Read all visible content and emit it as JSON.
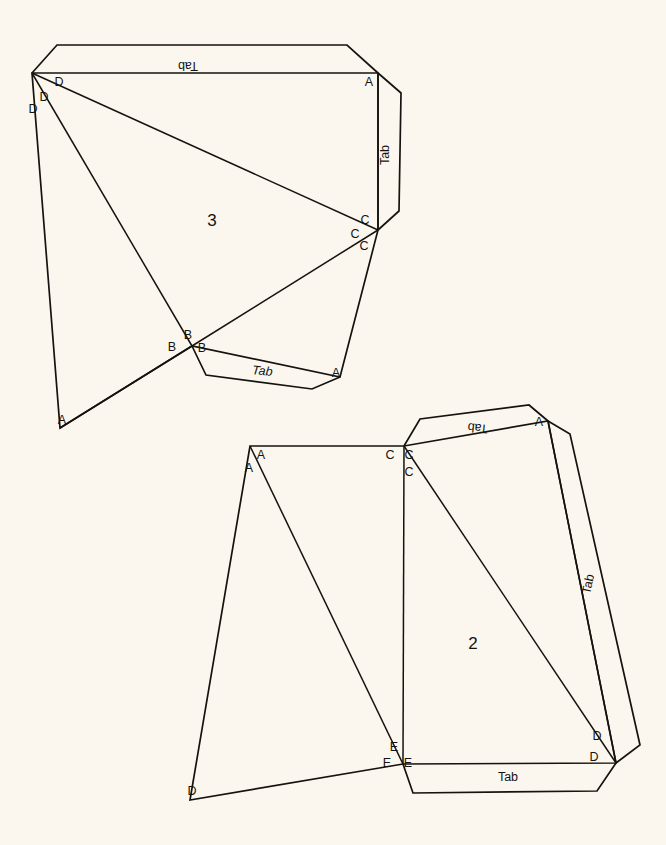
{
  "document": {
    "title": "Polyhedron Net Template",
    "background_color": "#fbf7ef",
    "ink_color": "#15130f",
    "width": 666,
    "height": 845
  },
  "nets": [
    {
      "id": "net-3",
      "number_label": "3",
      "number_pos": {
        "x": 212,
        "y": 226
      },
      "outline": "32,73 340,73 378,73 378,230 340,377 192,346 60,428",
      "vertex_labels": [
        {
          "text": "D",
          "x": 59,
          "y": 86,
          "name": "vertex-label-d-1"
        },
        {
          "text": "D",
          "x": 44,
          "y": 101,
          "name": "vertex-label-d-2"
        },
        {
          "text": "D",
          "x": 33,
          "y": 113,
          "name": "vertex-label-d-3"
        },
        {
          "text": "A",
          "x": 369,
          "y": 86,
          "name": "vertex-label-a-top"
        },
        {
          "text": "C",
          "x": 365,
          "y": 224,
          "name": "vertex-label-c-1"
        },
        {
          "text": "C",
          "x": 355,
          "y": 238,
          "name": "vertex-label-c-2"
        },
        {
          "text": "C",
          "x": 364,
          "y": 250,
          "name": "vertex-label-c-3"
        },
        {
          "text": "B",
          "x": 188,
          "y": 339,
          "name": "vertex-label-b-1"
        },
        {
          "text": "B",
          "x": 172,
          "y": 351,
          "name": "vertex-label-b-2"
        },
        {
          "text": "B",
          "x": 202,
          "y": 352,
          "name": "vertex-label-b-3"
        },
        {
          "text": "A",
          "x": 336,
          "y": 377,
          "name": "vertex-label-a-bottom"
        },
        {
          "text": "A",
          "x": 62,
          "y": 424,
          "name": "vertex-label-a-left"
        }
      ],
      "tabs": [
        {
          "name": "tab-top",
          "label": "Tab",
          "outline": "32,73 57,45 347,45 378,73",
          "label_pos": {
            "x": 188,
            "y": 62
          },
          "rotation": 180,
          "italic": false
        },
        {
          "name": "tab-right",
          "label": "Tab",
          "outline": "378,73 401,93 399,211 378,230",
          "label_pos": {
            "x": 389,
            "y": 155
          },
          "rotation": -90,
          "italic": false
        },
        {
          "name": "tab-bottom",
          "label": "Tab",
          "outline": "192,346 206,375 312,389 340,377",
          "label_pos": {
            "x": 262,
            "y": 375
          },
          "rotation": 6,
          "italic": true
        }
      ]
    },
    {
      "id": "net-2",
      "number_label": "2",
      "number_pos": {
        "x": 473,
        "y": 649
      },
      "outline": "250,446 404,446 548,421 616,763 403,764 190,800",
      "vertex_labels": [
        {
          "text": "A",
          "x": 261,
          "y": 459,
          "name": "vertex-label-a-1"
        },
        {
          "text": "A",
          "x": 249,
          "y": 472,
          "name": "vertex-label-a-2"
        },
        {
          "text": "C",
          "x": 390,
          "y": 459,
          "name": "vertex-label-c-1"
        },
        {
          "text": "C",
          "x": 409,
          "y": 459,
          "name": "vertex-label-c-2"
        },
        {
          "text": "C",
          "x": 409,
          "y": 476,
          "name": "vertex-label-c-3"
        },
        {
          "text": "A",
          "x": 539,
          "y": 426,
          "name": "vertex-label-a-tab"
        },
        {
          "text": "D",
          "x": 597,
          "y": 740,
          "name": "vertex-label-d-1"
        },
        {
          "text": "D",
          "x": 594,
          "y": 761,
          "name": "vertex-label-d-2"
        },
        {
          "text": "E",
          "x": 394,
          "y": 751,
          "name": "vertex-label-e-1"
        },
        {
          "text": "E",
          "x": 387,
          "y": 767,
          "name": "vertex-label-e-2"
        },
        {
          "text": "E",
          "x": 408,
          "y": 767,
          "name": "vertex-label-e-3"
        },
        {
          "text": "D",
          "x": 192,
          "y": 795,
          "name": "vertex-label-d-left"
        }
      ],
      "tabs": [
        {
          "name": "tab-top",
          "label": "Tab",
          "outline": "404,446 420,419 529,405 548,421",
          "label_pos": {
            "x": 478,
            "y": 424
          },
          "rotation": 186,
          "italic": false
        },
        {
          "name": "tab-right",
          "label": "Tab",
          "outline": "548,421 570,434 640,745 616,763",
          "label_pos": {
            "x": 592,
            "y": 585
          },
          "rotation": -78,
          "italic": false
        },
        {
          "name": "tab-bottom",
          "label": "Tab",
          "outline": "403,764 413,793 597,791 616,763",
          "label_pos": {
            "x": 508,
            "y": 781
          },
          "rotation": 0,
          "italic": false
        }
      ]
    }
  ],
  "creases": [
    {
      "net": "net-3",
      "name": "crease-d-to-c",
      "from": {
        "x": 32,
        "y": 73
      },
      "to": {
        "x": 378,
        "y": 230
      }
    },
    {
      "net": "net-3",
      "name": "crease-d-to-b",
      "from": {
        "x": 32,
        "y": 73
      },
      "to": {
        "x": 192,
        "y": 346
      }
    },
    {
      "net": "net-3",
      "name": "crease-b-to-a-left",
      "from": {
        "x": 192,
        "y": 346
      },
      "to": {
        "x": 60,
        "y": 428
      }
    },
    {
      "net": "net-3",
      "name": "crease-b-to-c",
      "from": {
        "x": 192,
        "y": 346
      },
      "to": {
        "x": 378,
        "y": 230
      }
    },
    {
      "net": "net-3",
      "name": "crease-a-to-c-right",
      "from": {
        "x": 378,
        "y": 73
      },
      "to": {
        "x": 378,
        "y": 230
      }
    },
    {
      "net": "net-2",
      "name": "crease-a-to-e",
      "from": {
        "x": 250,
        "y": 446
      },
      "to": {
        "x": 403,
        "y": 764
      }
    },
    {
      "net": "net-2",
      "name": "crease-c-to-e",
      "from": {
        "x": 404,
        "y": 446
      },
      "to": {
        "x": 403,
        "y": 764
      }
    },
    {
      "net": "net-2",
      "name": "crease-c-to-d",
      "from": {
        "x": 404,
        "y": 446
      },
      "to": {
        "x": 616,
        "y": 763
      }
    },
    {
      "net": "net-2",
      "name": "crease-a-to-d-right",
      "from": {
        "x": 548,
        "y": 421
      },
      "to": {
        "x": 616,
        "y": 763
      }
    }
  ]
}
